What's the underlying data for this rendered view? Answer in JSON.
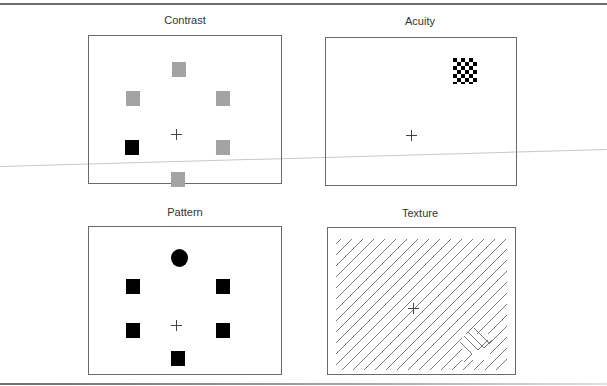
{
  "figure": {
    "panels": [
      {
        "id": "contrast",
        "title": "Contrast",
        "fixation": "cross",
        "items": [
          {
            "shape": "square",
            "color": "#a3a3a3",
            "position": "top"
          },
          {
            "shape": "square",
            "color": "#a3a3a3",
            "position": "upper-left"
          },
          {
            "shape": "square",
            "color": "#a3a3a3",
            "position": "upper-right"
          },
          {
            "shape": "square",
            "color": "#000000",
            "position": "lower-left",
            "target": true
          },
          {
            "shape": "square",
            "color": "#a3a3a3",
            "position": "lower-right"
          },
          {
            "shape": "square",
            "color": "#a3a3a3",
            "position": "bottom"
          }
        ]
      },
      {
        "id": "acuity",
        "title": "Acuity",
        "fixation": "cross",
        "items": [
          {
            "shape": "checkerboard",
            "grid": "6x6",
            "position": "upper-right",
            "target": true
          }
        ]
      },
      {
        "id": "pattern",
        "title": "Pattern",
        "fixation": "cross",
        "items": [
          {
            "shape": "circle",
            "color": "#000000",
            "position": "top",
            "target": true
          },
          {
            "shape": "square",
            "color": "#000000",
            "position": "upper-left"
          },
          {
            "shape": "square",
            "color": "#000000",
            "position": "upper-right"
          },
          {
            "shape": "square",
            "color": "#000000",
            "position": "lower-left"
          },
          {
            "shape": "square",
            "color": "#000000",
            "position": "lower-right"
          },
          {
            "shape": "square",
            "color": "#000000",
            "position": "bottom"
          }
        ]
      },
      {
        "id": "texture",
        "title": "Texture",
        "fixation": "cross",
        "background": "diagonal-lines",
        "items": [
          {
            "shape": "orthogonal-line-patch",
            "position": "lower-right",
            "target": true
          }
        ]
      }
    ]
  },
  "colors": {
    "border": "#6a6a6a",
    "gray_distractor": "#a3a3a3",
    "target": "#000000",
    "texture_line": "#7a7a7a"
  }
}
